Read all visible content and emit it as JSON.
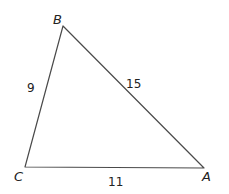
{
  "diagram": {
    "type": "triangle",
    "vertices": [
      {
        "label": "B",
        "x": 63,
        "y": 26
      },
      {
        "label": "C",
        "x": 25,
        "y": 167
      },
      {
        "label": "A",
        "x": 204,
        "y": 168
      }
    ],
    "sides": [
      {
        "between": "BC",
        "length_label": "9"
      },
      {
        "between": "BA",
        "length_label": "15"
      },
      {
        "between": "CA",
        "length_label": "11"
      }
    ],
    "colors": {
      "line": "#4a4a4a",
      "text": "#222222",
      "background": "#ffffff"
    }
  }
}
